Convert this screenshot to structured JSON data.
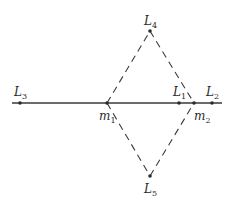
{
  "diagram": {
    "colors": {
      "line": "#3a3a3a",
      "point": "#2a2a2a",
      "background": "#ffffff"
    },
    "axis_line": {
      "x1": 12,
      "y1": 103,
      "x2": 222,
      "y2": 103
    },
    "masses": [
      {
        "id": "m1",
        "symbol": "m",
        "subscript": "1",
        "x": 107,
        "y": 103,
        "label_x": 99,
        "label_y": 120
      },
      {
        "id": "m2",
        "symbol": "m",
        "subscript": "2",
        "x": 194,
        "y": 103,
        "label_x": 194,
        "label_y": 120
      }
    ],
    "points": [
      {
        "id": "L1",
        "symbol": "L",
        "subscript": "1",
        "x": 179,
        "y": 103,
        "label_x": 173,
        "label_y": 96
      },
      {
        "id": "L2",
        "symbol": "L",
        "subscript": "2",
        "x": 212,
        "y": 103,
        "label_x": 206,
        "label_y": 96
      },
      {
        "id": "L3",
        "symbol": "L",
        "subscript": "3",
        "x": 20,
        "y": 103,
        "label_x": 14,
        "label_y": 96
      },
      {
        "id": "L4",
        "symbol": "L",
        "subscript": "4",
        "x": 150,
        "y": 31,
        "label_x": 144,
        "label_y": 25
      },
      {
        "id": "L5",
        "symbol": "L",
        "subscript": "5",
        "x": 150,
        "y": 176,
        "label_x": 144,
        "label_y": 193
      }
    ],
    "dashed_lines": [
      {
        "from": "m1",
        "to": "L4"
      },
      {
        "from": "L4",
        "to": "m2"
      },
      {
        "from": "m1",
        "to": "L5"
      },
      {
        "from": "L5",
        "to": "m2"
      }
    ]
  }
}
